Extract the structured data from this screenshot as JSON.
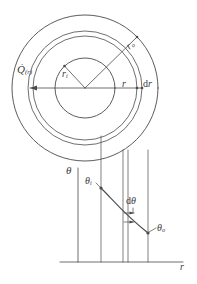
{
  "figure": {
    "kind": "engineering-diagram",
    "stroke_color": "#4a4a4a",
    "label_color": "#3a3a3a",
    "background": "#ffffff"
  },
  "annulus": {
    "center": {
      "x": 85,
      "y": 88
    },
    "radii": {
      "inner": 30,
      "element_inner": 52,
      "element_outer": 57,
      "outer": 73
    },
    "labels": {
      "heat_flow": "Q",
      "heat_flow_arg": "(r)",
      "inner_radius": "r",
      "inner_radius_sub": "i",
      "outer_radius": "r",
      "outer_radius_sub": "o",
      "radius": "r",
      "thickness": "d",
      "thickness_var": "r"
    }
  },
  "profile": {
    "axes": {
      "vertical_label": "θ",
      "horizontal_label": "r",
      "origin": {
        "x": 78,
        "y": 262
      },
      "x_end": 183,
      "y_top": 168
    },
    "curve_labels": {
      "inner_temp": "θ",
      "inner_temp_sub": "i",
      "outer_temp": "θ",
      "outer_temp_sub": "o",
      "delta": "d",
      "delta_var": "θ"
    },
    "points": {
      "inner": {
        "x": 101,
        "y": 188
      },
      "outer": {
        "x": 148,
        "y": 233
      }
    },
    "gridlines_x": [
      78,
      101,
      123,
      128,
      148
    ]
  }
}
